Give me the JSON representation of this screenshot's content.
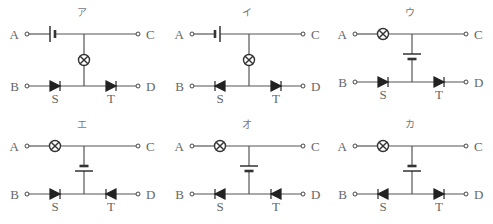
{
  "diagram": {
    "terminal_labels": {
      "A": "A",
      "B": "B",
      "C": "C",
      "D": "D"
    },
    "diode_labels": {
      "S": "S",
      "T": "T"
    },
    "circuits": [
      {
        "id": "a",
        "title": "ア",
        "layout": "battery-top",
        "battery_long_side": "left",
        "diode_S": "right",
        "diode_T": "right"
      },
      {
        "id": "i",
        "title": "イ",
        "layout": "battery-top",
        "battery_long_side": "right",
        "diode_S": "left",
        "diode_T": "right"
      },
      {
        "id": "u",
        "title": "ウ",
        "layout": "lamp-top",
        "battery_long_side": "top",
        "diode_S": "right",
        "diode_T": "right"
      },
      {
        "id": "e",
        "title": "エ",
        "layout": "lamp-top",
        "battery_long_side": "bottom",
        "diode_S": "right",
        "diode_T": "left"
      },
      {
        "id": "o",
        "title": "オ",
        "layout": "lamp-top",
        "battery_long_side": "top",
        "diode_S": "left",
        "diode_T": "left"
      },
      {
        "id": "ka",
        "title": "カ",
        "layout": "lamp-top",
        "battery_long_side": "bottom",
        "diode_S": "left",
        "diode_T": "right"
      }
    ]
  }
}
